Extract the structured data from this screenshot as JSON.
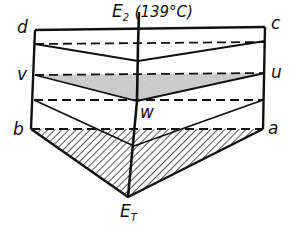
{
  "diagram": {
    "labels": {
      "top_eutectic_main": "E",
      "top_eutectic_sub": "2",
      "top_eutectic_temp": "(139°C)",
      "d": "d",
      "c": "c",
      "v": "v",
      "u": "u",
      "w": "w",
      "b": "b",
      "a": "a",
      "bottom_eutectic_main": "E",
      "bottom_eutectic_sub": "T"
    },
    "colors": {
      "line": "#111111",
      "shade": "#c8c8c8",
      "hatch": "#111111",
      "background": "#ffffff"
    }
  }
}
